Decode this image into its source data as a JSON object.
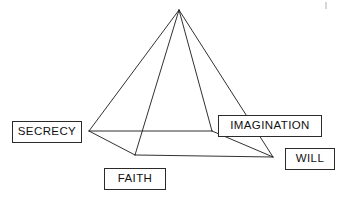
{
  "diagram": {
    "type": "pyramid-diagram",
    "stroke_color": "#1a1a1a",
    "background_color": "#ffffff",
    "label_text_color": "#111111",
    "label_border_color": "#2b2b2b",
    "apex": {
      "x": 179,
      "y": 10
    },
    "vertices": [
      {
        "name": "left-base-vertex",
        "x": 89,
        "y": 131
      },
      {
        "name": "back-base-vertex",
        "x": 212,
        "y": 131
      },
      {
        "name": "front-base-vertex",
        "x": 135,
        "y": 155
      },
      {
        "name": "right-base-vertex",
        "x": 273,
        "y": 157
      }
    ],
    "edges": [
      {
        "name": "apex-to-left",
        "from": "apex",
        "to": "left-base-vertex"
      },
      {
        "name": "apex-to-back",
        "from": "apex",
        "to": "back-base-vertex"
      },
      {
        "name": "apex-to-front",
        "from": "apex",
        "to": "front-base-vertex"
      },
      {
        "name": "apex-to-right",
        "from": "apex",
        "to": "right-base-vertex"
      },
      {
        "name": "left-to-back",
        "from": "left-base-vertex",
        "to": "back-base-vertex"
      },
      {
        "name": "back-to-right",
        "from": "back-base-vertex",
        "to": "right-base-vertex"
      },
      {
        "name": "left-to-front",
        "from": "left-base-vertex",
        "to": "front-base-vertex"
      },
      {
        "name": "front-to-right",
        "from": "front-base-vertex",
        "to": "right-base-vertex"
      }
    ],
    "labels": [
      {
        "key": "secrecy",
        "text": "SECRECY",
        "left": 12,
        "top": 121,
        "width": 70,
        "height": 22,
        "font_size": 11.5,
        "attaches_to": "left-base-vertex"
      },
      {
        "key": "imagination",
        "text": "IMAGINATION",
        "left": 218,
        "top": 115,
        "width": 104,
        "height": 22,
        "font_size": 11.5,
        "attaches_to": "back-base-vertex"
      },
      {
        "key": "faith",
        "text": "FAITH",
        "left": 104,
        "top": 168,
        "width": 62,
        "height": 22,
        "font_size": 11.5,
        "attaches_to": "front-base-vertex"
      },
      {
        "key": "will",
        "text": "WILL",
        "left": 285,
        "top": 148,
        "width": 50,
        "height": 22,
        "font_size": 11.5,
        "attaches_to": "right-base-vertex"
      }
    ],
    "corner_mark": {
      "x": 326,
      "y": 2,
      "length": 7
    }
  }
}
